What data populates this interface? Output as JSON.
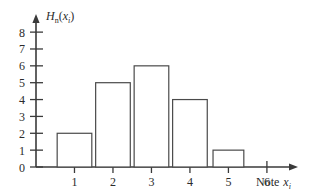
{
  "chart_data": {
    "type": "bar",
    "title": "",
    "subtitle": "",
    "ylabel": "H_n(x_i)",
    "ylabel_parts": {
      "base": "H",
      "sub": "n",
      "open": "(",
      "var": "x",
      "varsub": "i",
      "close": ")"
    },
    "xlabel": "Note x_i",
    "xlabel_parts": {
      "word": "Note",
      "var": "x",
      "varsub": "i"
    },
    "categories": [
      "1",
      "2",
      "3",
      "4",
      "5",
      "6"
    ],
    "values": [
      2,
      5,
      6,
      4,
      1,
      0
    ],
    "x": [
      1,
      2,
      3,
      4,
      5,
      6
    ],
    "xlim": [
      0,
      6.6
    ],
    "ylim": [
      0,
      8.6
    ],
    "yticks": [
      "0",
      "1",
      "2",
      "3",
      "4",
      "5",
      "6",
      "7",
      "8"
    ],
    "ytick_values": [
      0,
      1,
      2,
      3,
      4,
      5,
      6,
      7,
      8
    ],
    "xticks": [
      "1",
      "2",
      "3",
      "4",
      "5",
      "6"
    ],
    "grid": false,
    "legend": false,
    "legend_position": "none",
    "bar_fill": "#ffffff",
    "bar_edge": "#4a4a4a",
    "axis_color": "#3a3a3a",
    "background": "#ffffff",
    "axes_style": "arrowed",
    "bars": [
      {
        "category": "1",
        "value": 2,
        "x_left": 0.55,
        "x_right": 1.45
      },
      {
        "category": "2",
        "value": 5,
        "x_left": 1.55,
        "x_right": 2.45
      },
      {
        "category": "3",
        "value": 6,
        "x_left": 2.55,
        "x_right": 3.45
      },
      {
        "category": "4",
        "value": 4,
        "x_left": 3.55,
        "x_right": 4.45
      },
      {
        "category": "5",
        "value": 1,
        "x_left": 4.6,
        "x_right": 5.4
      }
    ]
  }
}
